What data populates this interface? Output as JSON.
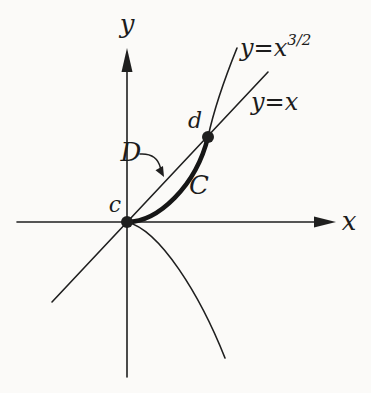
{
  "figure": {
    "type": "curve-sketch",
    "background_color": "#fbfaf8",
    "ink_color": "#1f1f1f"
  },
  "axes": {
    "x_label": "x",
    "y_label": "y"
  },
  "points": {
    "origin_label": "c",
    "intersection_label": "d"
  },
  "curves": {
    "power_curve_label_base": "y=x",
    "power_curve_label_exponent": "3/2",
    "line_label": "y=x",
    "thick_arc_label": "C",
    "region_label": "D"
  }
}
